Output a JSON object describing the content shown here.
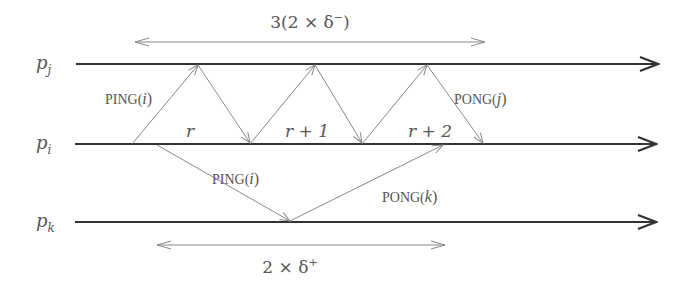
{
  "diagram": {
    "type": "space-time message diagram",
    "processes": [
      {
        "id": "pj",
        "label_base": "p",
        "label_sub": "j",
        "y": 64
      },
      {
        "id": "pi",
        "label_base": "p",
        "label_sub": "i",
        "y": 144
      },
      {
        "id": "pk",
        "label_base": "p",
        "label_sub": "k",
        "y": 222
      }
    ],
    "top_interval": {
      "label": "3(2 × δ",
      "label_sup": "−",
      "label_close": ")",
      "x_start": 135,
      "x_end": 485
    },
    "bottom_interval": {
      "label": "2 × δ",
      "label_sup": "+",
      "x_start": 157,
      "x_end": 445
    },
    "round_labels": [
      {
        "text": "r",
        "x": 190,
        "y": 137
      },
      {
        "text": "r + 1",
        "x": 307,
        "y": 137
      },
      {
        "text": "r + 2",
        "x": 430,
        "y": 137
      }
    ],
    "messages": [
      {
        "name": "ping-i-to-j-1",
        "from": "pi",
        "to": "pj",
        "x1": 132,
        "x2": 198
      },
      {
        "name": "pong-j-to-i-1",
        "from": "pj",
        "to": "pi",
        "x1": 198,
        "x2": 250
      },
      {
        "name": "ping-i-to-j-2",
        "from": "pi",
        "to": "pj",
        "x1": 250,
        "x2": 315
      },
      {
        "name": "pong-j-to-i-2",
        "from": "pj",
        "to": "pi",
        "x1": 315,
        "x2": 362
      },
      {
        "name": "ping-i-to-j-3",
        "from": "pi",
        "to": "pj",
        "x1": 362,
        "x2": 427
      },
      {
        "name": "pong-j-to-i-3",
        "from": "pj",
        "to": "pi",
        "x1": 427,
        "x2": 483
      },
      {
        "name": "ping-i-to-k",
        "from": "pi",
        "to": "pk",
        "x1": 157,
        "x2": 290
      },
      {
        "name": "pong-k-to-i",
        "from": "pk",
        "to": "pi",
        "x1": 290,
        "x2": 443
      }
    ],
    "message_labels": [
      {
        "name": "ping-i-upper-label",
        "prefix": "PING(",
        "arg": "i",
        "suffix": ")",
        "x": 105,
        "y": 104
      },
      {
        "name": "pong-j-label",
        "prefix": "PONG(",
        "arg": "j",
        "suffix": ")",
        "x": 454,
        "y": 104
      },
      {
        "name": "ping-i-lower-label",
        "prefix": "PING(",
        "arg": "i",
        "suffix": ")",
        "x": 212,
        "y": 184
      },
      {
        "name": "pong-k-label",
        "prefix": "PONG(",
        "arg": "k",
        "suffix": ")",
        "x": 382,
        "y": 202
      }
    ],
    "colors": {
      "timeline": "#333333",
      "message": "#888888",
      "text": "#555555"
    }
  }
}
